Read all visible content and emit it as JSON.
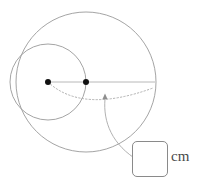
{
  "figure": {
    "type": "two-circles-radius-diagram",
    "stroke_color": "#9a9a9a",
    "dot_color": "#111111",
    "background_color": "#ffffff",
    "large_circle": {
      "name": "large-circle",
      "center_x": 86,
      "center_y": 82,
      "radius": 70
    },
    "small_circle": {
      "name": "small-circle",
      "center_x": 48,
      "center_y": 82,
      "radius": 38
    },
    "center_dot_small": {
      "name": "small-circle-center-dot",
      "x": 48,
      "y": 82,
      "r": 3
    },
    "center_dot_large": {
      "name": "large-circle-center-dot",
      "x": 86,
      "y": 82,
      "r": 3
    },
    "radius_line": {
      "name": "horizontal-radius-line",
      "x1": 48,
      "y1": 82,
      "x2": 155,
      "y2": 82
    },
    "dotted_arc": {
      "name": "dotted-measure-arc",
      "path": "M 48 82 Q 80 112 152 90",
      "dash": "1.5 2"
    },
    "leader_line": {
      "name": "callout-leader-line",
      "path": "M 105 100 C 104 126 118 150 141 159",
      "arrow_tip_x": 105,
      "arrow_tip_y": 94
    }
  },
  "answer": {
    "value": "",
    "placeholder": "",
    "unit_label": "cm"
  }
}
